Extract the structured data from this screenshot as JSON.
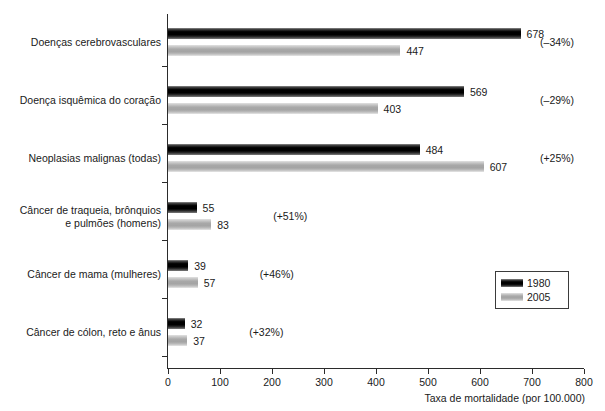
{
  "chart_data": {
    "type": "bar",
    "orientation": "horizontal",
    "title": "",
    "xlabel": "Taxa de mortalidade (por 100.000)",
    "ylabel": "",
    "xlim": [
      0,
      800
    ],
    "xticks": [
      0,
      100,
      200,
      300,
      400,
      500,
      600,
      700,
      800
    ],
    "xtick_labels": [
      "0",
      "100",
      "200",
      "300",
      "400",
      "500",
      "600",
      "700",
      "800"
    ],
    "grid": false,
    "legend_position": "right-lower",
    "categories": [
      "Doenças cerebrovasculares",
      "Doença isquêmica do coração",
      "Neoplasias malignas (todas)",
      "Câncer de traqueia, brônquios\ne pulmões (homens)",
      "Câncer de mama (mulheres)",
      "Câncer de cólon, reto e ânus"
    ],
    "series": [
      {
        "name": "1980",
        "color": "#000000",
        "values": [
          678,
          569,
          484,
          55,
          39,
          32
        ]
      },
      {
        "name": "2005",
        "color": "#a8a8a8",
        "values": [
          447,
          403,
          607,
          83,
          57,
          37
        ]
      }
    ],
    "annotations": [
      "(–34%)",
      "(–29%)",
      "(+25%)",
      "(+51%)",
      "(+46%)",
      "(+32%)"
    ],
    "value_labels": {
      "1980": [
        "678",
        "569",
        "484",
        "55",
        "39",
        "32"
      ],
      "2005": [
        "447",
        "403",
        "607",
        "83",
        "57",
        "37"
      ]
    }
  },
  "legend": {
    "entries": [
      {
        "label": "1980",
        "swatch": "black-gradient"
      },
      {
        "label": "2005",
        "swatch": "gray-gradient"
      }
    ]
  },
  "header": {
    "cropped_fragment": ""
  }
}
